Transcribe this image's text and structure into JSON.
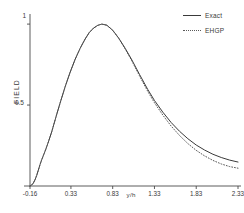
{
  "chart_data": {
    "type": "line",
    "title": "",
    "xlabel": "y/h",
    "ylabel": "FIELD",
    "xlim": [
      -0.16,
      2.33
    ],
    "ylim": [
      0,
      1.05
    ],
    "grid": false,
    "legend_position": "top-right",
    "xticks": [
      {
        "value": -0.16,
        "label": "-0.16"
      },
      {
        "value": 0.33,
        "label": "0.33"
      },
      {
        "value": 0.83,
        "label": "0.83"
      },
      {
        "value": 1.33,
        "label": "1.33"
      },
      {
        "value": 1.83,
        "label": "1.83"
      },
      {
        "value": 2.33,
        "label": "2.33"
      }
    ],
    "yticks": [
      {
        "value": 0.5,
        "label": "0.5"
      },
      {
        "value": 1.0,
        "label": "1"
      }
    ],
    "series": [
      {
        "name": "Exact",
        "style": "solid",
        "color": "#3a3a3a",
        "x": [
          -0.16,
          -0.14,
          -0.12,
          -0.1,
          -0.08,
          -0.06,
          -0.04,
          -0.02,
          0.0,
          0.03,
          0.06,
          0.1,
          0.15,
          0.2,
          0.26,
          0.32,
          0.38,
          0.44,
          0.5,
          0.55,
          0.6,
          0.65,
          0.7,
          0.76,
          0.83,
          0.9,
          0.98,
          1.06,
          1.15,
          1.25,
          1.33,
          1.43,
          1.53,
          1.63,
          1.73,
          1.83,
          1.93,
          2.03,
          2.13,
          2.23,
          2.33
        ],
        "y": [
          0.0,
          0.006,
          0.018,
          0.038,
          0.065,
          0.098,
          0.132,
          0.162,
          0.188,
          0.228,
          0.272,
          0.335,
          0.425,
          0.512,
          0.612,
          0.702,
          0.782,
          0.85,
          0.908,
          0.948,
          0.975,
          0.992,
          1.0,
          0.993,
          0.962,
          0.915,
          0.85,
          0.778,
          0.69,
          0.596,
          0.528,
          0.456,
          0.392,
          0.338,
          0.292,
          0.253,
          0.222,
          0.196,
          0.176,
          0.16,
          0.148
        ]
      },
      {
        "name": "EHGP",
        "style": "dotted",
        "color": "#5a5a5a",
        "x": [
          -0.16,
          -0.14,
          -0.12,
          -0.1,
          -0.08,
          -0.06,
          -0.04,
          -0.02,
          0.0,
          0.03,
          0.06,
          0.1,
          0.15,
          0.2,
          0.26,
          0.32,
          0.38,
          0.44,
          0.5,
          0.55,
          0.6,
          0.65,
          0.7,
          0.76,
          0.83,
          0.9,
          0.98,
          1.06,
          1.15,
          1.25,
          1.33,
          1.43,
          1.53,
          1.63,
          1.73,
          1.83,
          1.93,
          2.03,
          2.13,
          2.23,
          2.33
        ],
        "y": [
          0.0,
          0.006,
          0.018,
          0.038,
          0.065,
          0.098,
          0.132,
          0.162,
          0.188,
          0.228,
          0.272,
          0.335,
          0.425,
          0.512,
          0.612,
          0.702,
          0.782,
          0.85,
          0.908,
          0.948,
          0.975,
          0.992,
          1.0,
          0.993,
          0.962,
          0.913,
          0.846,
          0.772,
          0.681,
          0.584,
          0.514,
          0.438,
          0.37,
          0.312,
          0.262,
          0.22,
          0.186,
          0.158,
          0.136,
          0.12,
          0.11
        ]
      }
    ],
    "legend": [
      {
        "label": "Exact",
        "style": "solid"
      },
      {
        "label": "EHGP",
        "style": "dotted"
      }
    ]
  }
}
